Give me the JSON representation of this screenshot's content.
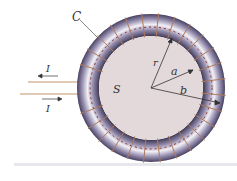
{
  "figure": {
    "type": "toroidal coil diagram",
    "labels": {
      "curve": "C",
      "surface": "S",
      "radius_r": "r",
      "radius_a": "a",
      "radius_b": "b",
      "current_top": "I",
      "current_bottom": "I"
    },
    "colors": {
      "torus": "#8e86a8",
      "torus_highlight": "#f2f0f6",
      "winding": "#b07a5a",
      "inner_disc": "#e3d9db",
      "dashed_path": "#8a2a2a",
      "leads": "#d6b89a"
    }
  }
}
